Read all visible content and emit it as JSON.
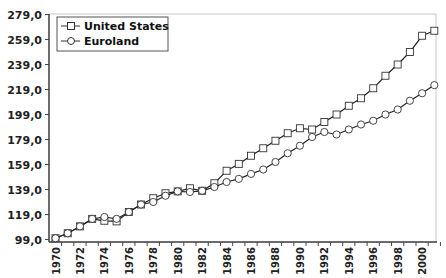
{
  "chart_data": {
    "type": "line",
    "title": "",
    "xlabel": "",
    "ylabel": "",
    "x": [
      1970,
      1971,
      1972,
      1973,
      1974,
      1975,
      1976,
      1977,
      1978,
      1979,
      1980,
      1981,
      1982,
      1983,
      1984,
      1985,
      1986,
      1987,
      1988,
      1989,
      1990,
      1991,
      1992,
      1993,
      1994,
      1995,
      1996,
      1997,
      1998,
      1999,
      2000,
      2001
    ],
    "x_tick_labels": [
      "1970",
      "1972",
      "1974",
      "1976",
      "1978",
      "1980",
      "1982",
      "1984",
      "1986",
      "1988",
      "1990",
      "1992",
      "1994",
      "1996",
      "1998",
      "2000"
    ],
    "y_tick_labels": [
      "99,0",
      "119,0",
      "139,0",
      "159,0",
      "179,0",
      "199,0",
      "219,0",
      "239,0",
      "259,0",
      "279,0"
    ],
    "ylim": [
      99,
      279
    ],
    "grid": false,
    "legend_position": "top-left",
    "series": [
      {
        "name": "United States",
        "marker": "square",
        "values": [
          100,
          104,
          109.5,
          115.5,
          114,
          113.5,
          121,
          127,
          132,
          136,
          137.5,
          140,
          138,
          144,
          154,
          159.5,
          166,
          172,
          178,
          184,
          188,
          187,
          193,
          199,
          206,
          212,
          220,
          230,
          239,
          249,
          262,
          266
        ]
      },
      {
        "name": "Euroland",
        "marker": "circle",
        "values": [
          100,
          104,
          109.5,
          115.5,
          117,
          115.5,
          121,
          127,
          129,
          134,
          137.5,
          137,
          138,
          141,
          145,
          147.5,
          151.5,
          155,
          161,
          168,
          174,
          181,
          185,
          183,
          187,
          191,
          194,
          199,
          203,
          210,
          216,
          222.5
        ]
      }
    ]
  },
  "legend": {
    "items": [
      {
        "label": "United States",
        "marker": "square"
      },
      {
        "label": "Euroland",
        "marker": "circle"
      }
    ]
  },
  "colors": {
    "line": "#222222",
    "marker_fill": "#ffffff",
    "axis": "#444444",
    "border": "#bbbbbb"
  }
}
